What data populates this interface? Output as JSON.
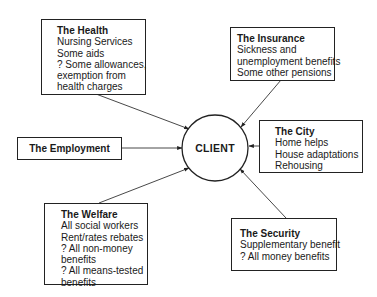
{
  "center": {
    "label": "CLIENT"
  },
  "nodes": [
    {
      "id": "health",
      "title": "The Health",
      "lines": [
        "Nursing Services",
        "Some aids",
        "? Some allowances,",
        "exemption from",
        "health charges"
      ]
    },
    {
      "id": "insurance",
      "title": "The Insurance",
      "lines": [
        "Sickness and",
        "unemployment benefits",
        "Some other pensions"
      ]
    },
    {
      "id": "city",
      "title": "The City",
      "lines": [
        "Home helps",
        "House adaptations",
        "Rehousing"
      ]
    },
    {
      "id": "employment",
      "title": "The Employment",
      "lines": []
    },
    {
      "id": "welfare",
      "title": "The Welfare",
      "lines": [
        "All social workers",
        "Rent/rates rebates",
        "? All non-money",
        "benefits",
        "? All means-tested",
        "benefits"
      ]
    },
    {
      "id": "security",
      "title": "The Security",
      "lines": [
        "Supplementary benefit",
        "? All money benefits"
      ]
    }
  ],
  "edges": [
    {
      "from": "health",
      "to": "client"
    },
    {
      "from": "insurance",
      "to": "client"
    },
    {
      "from": "city",
      "to": "client"
    },
    {
      "from": "employment",
      "to": "client"
    },
    {
      "from": "welfare",
      "to": "client"
    },
    {
      "from": "security",
      "to": "client"
    }
  ]
}
